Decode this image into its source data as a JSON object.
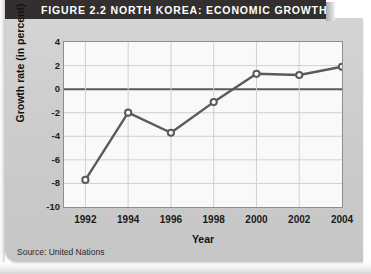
{
  "figure": {
    "banner_label": "FIGURE 2.2   NORTH KOREA: ECONOMIC GROWTH",
    "source_note": "Source: United Nations",
    "banner_color": "#332f2e",
    "card_color": "#cfcfcf",
    "plot_bg_color": "#f9f9f9",
    "line_color": "#5a5a5a",
    "gridline_color": "#d0d0d0",
    "zeroline_color": "#5a5a5a"
  },
  "chart_data": {
    "type": "line",
    "title": "FIGURE 2.2   NORTH KOREA: ECONOMIC GROWTH",
    "xlabel": "Year",
    "ylabel": "Growth rate (in percent)",
    "x": [
      1992,
      1994,
      1996,
      1998,
      2000,
      2002,
      2004
    ],
    "xtick_labels": [
      "1992",
      "1994",
      "1996",
      "1998",
      "2000",
      "2002",
      "2004"
    ],
    "values": [
      -7.7,
      -2.0,
      -3.7,
      -1.1,
      1.3,
      1.2,
      1.9
    ],
    "ylim": [
      -10,
      4
    ],
    "xlim": [
      1991,
      2004
    ],
    "ytick_labels": [
      "4",
      "2",
      "0",
      "-2",
      "-4",
      "-6",
      "-8",
      "-10"
    ],
    "yticks": [
      4,
      2,
      0,
      -2,
      -4,
      -6,
      -8,
      -10
    ],
    "grid": true,
    "legend": "none",
    "marker": "open-circle",
    "series": [
      {
        "name": "Growth rate (in percent)",
        "values": [
          -7.7,
          -2.0,
          -3.7,
          -1.1,
          1.3,
          1.2,
          1.9
        ]
      }
    ]
  }
}
